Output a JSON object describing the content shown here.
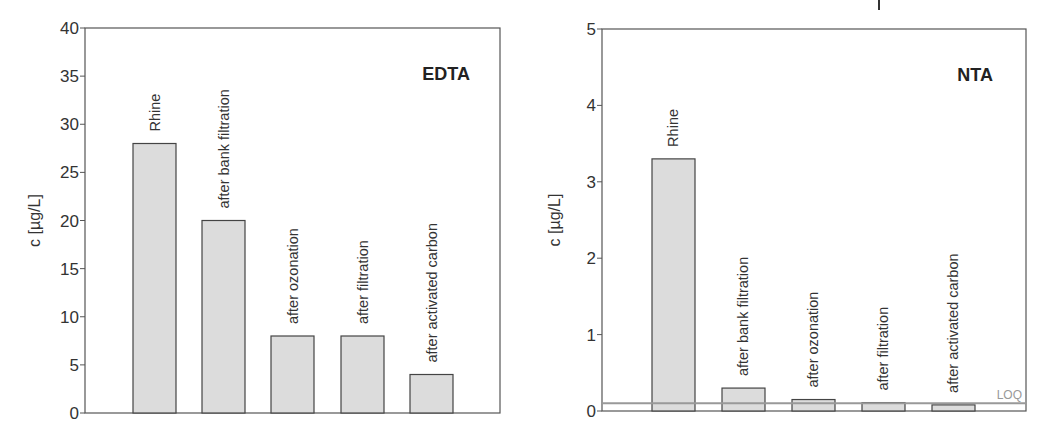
{
  "chart_data": [
    {
      "type": "bar",
      "title": "EDTA",
      "xlabel": "",
      "ylabel": "c [µg/L]",
      "ylim": [
        0,
        40
      ],
      "yticks": [
        0,
        5,
        10,
        15,
        20,
        25,
        30,
        35,
        40
      ],
      "categories": [
        "Rhine",
        "after bank filtration",
        "after ozonation",
        "after filtration",
        "after activated carbon"
      ],
      "values": [
        28,
        20,
        8,
        8,
        4
      ],
      "grid": false,
      "legend": null
    },
    {
      "type": "bar",
      "title": "NTA",
      "xlabel": "",
      "ylabel": "c [µg/L]",
      "ylim": [
        0,
        5
      ],
      "yticks": [
        0,
        1,
        2,
        3,
        4,
        5
      ],
      "categories": [
        "Rhine",
        "after bank filtration",
        "after ozonation",
        "after filtration",
        "after activated carbon"
      ],
      "values": [
        3.3,
        0.3,
        0.15,
        0.11,
        0.08
      ],
      "grid": false,
      "legend": null,
      "annotations": [
        {
          "type": "hline",
          "label": "LOQ",
          "y": 0.1
        }
      ]
    }
  ],
  "style": {
    "bar_fill": "#dcdcdc",
    "bar_stroke": "#444444",
    "loq_color": "#999999"
  }
}
